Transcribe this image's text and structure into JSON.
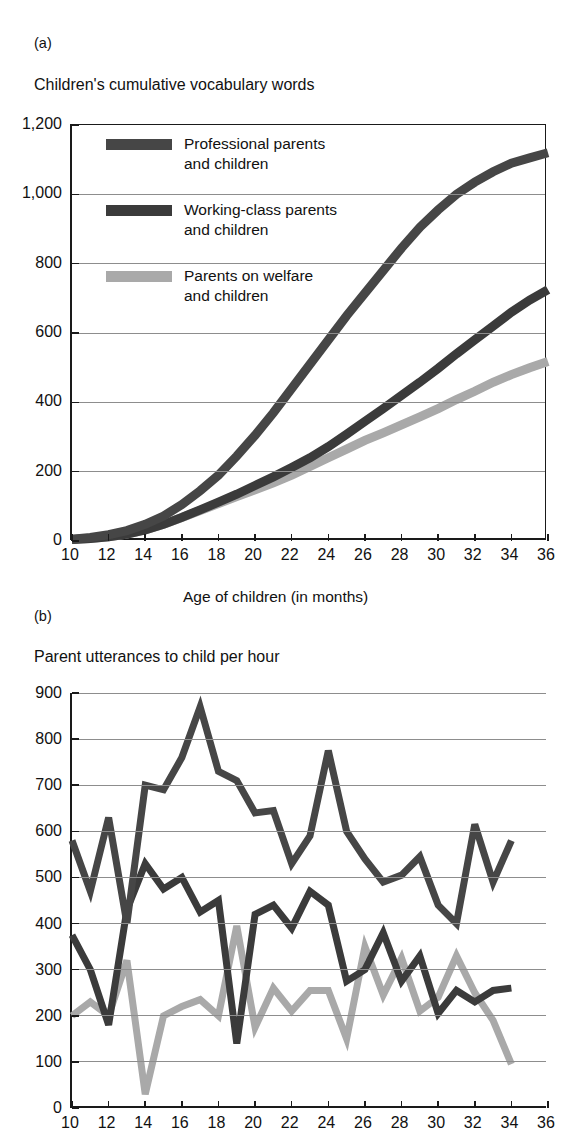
{
  "page": {
    "top_fragment": "",
    "background": "#ffffff"
  },
  "colors": {
    "professional": "#464646",
    "working_class": "#3b3b3b",
    "welfare": "#a9a9a9",
    "axis": "#1a1a1a",
    "grid": "#8d8d8d"
  },
  "panel_a": {
    "letter": "(a)",
    "title": "Children's cumulative vocabulary words",
    "xlabel": "Age of children (in months)",
    "legend": [
      {
        "label_line1": "Professional parents",
        "label_line2": "and children",
        "color": "#464646"
      },
      {
        "label_line1": "Working-class parents",
        "label_line2": "and children",
        "color": "#3b3b3b"
      },
      {
        "label_line1": "Parents on welfare",
        "label_line2": "and children",
        "color": "#a9a9a9"
      }
    ]
  },
  "panel_b": {
    "letter": "(b)",
    "title": "Parent utterances to child per hour"
  },
  "chart_data": [
    {
      "id": "panel-a",
      "type": "line",
      "title": "Children's cumulative vocabulary words",
      "xlabel": "Age of children (in months)",
      "ylabel": "",
      "xlim": [
        10,
        36
      ],
      "ylim": [
        0,
        1200
      ],
      "xticks": [
        10,
        12,
        14,
        16,
        18,
        20,
        22,
        24,
        26,
        28,
        30,
        32,
        34,
        36
      ],
      "yticks": [
        0,
        200,
        400,
        600,
        800,
        1000,
        1200
      ],
      "ytick_labels": [
        "0",
        "200",
        "400",
        "600",
        "800",
        "1,000",
        "1,200"
      ],
      "grid": true,
      "legend_position": "inside-upper-left",
      "x": [
        10,
        11,
        12,
        13,
        14,
        15,
        16,
        17,
        18,
        19,
        20,
        21,
        22,
        23,
        24,
        25,
        26,
        27,
        28,
        29,
        30,
        31,
        32,
        33,
        34,
        35,
        36
      ],
      "series": [
        {
          "name": "Professional parents and children",
          "color": "#464646",
          "values": [
            5,
            10,
            18,
            30,
            48,
            72,
            105,
            145,
            190,
            245,
            305,
            370,
            440,
            510,
            580,
            650,
            715,
            780,
            845,
            905,
            955,
            1000,
            1035,
            1065,
            1090,
            1105,
            1120
          ]
        },
        {
          "name": "Working-class parents and children",
          "color": "#3b3b3b",
          "values": [
            4,
            7,
            12,
            20,
            32,
            48,
            68,
            90,
            112,
            135,
            160,
            185,
            212,
            240,
            272,
            308,
            345,
            382,
            420,
            458,
            498,
            540,
            580,
            620,
            660,
            695,
            725
          ]
        },
        {
          "name": "Parents on welfare and children",
          "color": "#a9a9a9",
          "values": [
            4,
            7,
            12,
            20,
            32,
            48,
            68,
            88,
            108,
            128,
            148,
            168,
            190,
            215,
            240,
            265,
            290,
            312,
            335,
            358,
            382,
            408,
            432,
            458,
            480,
            500,
            518
          ]
        }
      ]
    },
    {
      "id": "panel-b",
      "type": "line",
      "title": "Parent utterances to child per hour",
      "xlabel": "",
      "ylabel": "",
      "xlim": [
        10,
        36
      ],
      "ylim": [
        0,
        900
      ],
      "xticks": [
        10,
        12,
        14,
        16,
        18,
        20,
        22,
        24,
        26,
        28,
        30,
        32,
        34,
        36
      ],
      "yticks": [
        0,
        100,
        200,
        300,
        400,
        500,
        600,
        700,
        800,
        900
      ],
      "ytick_labels": [
        "0",
        "100",
        "200",
        "300",
        "400",
        "500",
        "600",
        "700",
        "800",
        "900"
      ],
      "grid": true,
      "legend_position": "none",
      "x": [
        10,
        11,
        12,
        13,
        14,
        15,
        16,
        17,
        18,
        19,
        20,
        21,
        22,
        23,
        24,
        25,
        26,
        27,
        28,
        29,
        30,
        31,
        32,
        33,
        34
      ],
      "series": [
        {
          "name": "Professional parents and children",
          "color": "#464646",
          "values": [
            580,
            470,
            630,
            400,
            700,
            690,
            760,
            870,
            730,
            710,
            640,
            645,
            530,
            590,
            775,
            600,
            540,
            490,
            505,
            545,
            440,
            400,
            615,
            490,
            580
          ]
        },
        {
          "name": "Working-class parents and children",
          "color": "#3b3b3b",
          "values": [
            375,
            300,
            180,
            430,
            530,
            475,
            500,
            425,
            450,
            140,
            420,
            440,
            390,
            470,
            440,
            275,
            300,
            380,
            275,
            330,
            205,
            255,
            230,
            255,
            260
          ]
        },
        {
          "name": "Parents on welfare and children",
          "color": "#a9a9a9",
          "values": [
            200,
            230,
            200,
            320,
            30,
            200,
            220,
            235,
            200,
            395,
            175,
            260,
            210,
            255,
            255,
            150,
            350,
            245,
            325,
            210,
            240,
            330,
            250,
            190,
            95
          ]
        }
      ]
    }
  ]
}
